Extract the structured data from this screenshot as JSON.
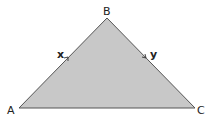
{
  "diagram": {
    "shape": "triangle",
    "fill_color": "#c8c8c8",
    "stroke_color": "#555555",
    "vertices": [
      {
        "label": "A",
        "x": 19,
        "y": 108
      },
      {
        "label": "B",
        "x": 107,
        "y": 18
      },
      {
        "label": "C",
        "x": 195,
        "y": 108
      }
    ],
    "vectors": [
      {
        "label": "x",
        "from": "A",
        "to": "B",
        "direction": "A to B"
      },
      {
        "label": "y",
        "from": "B",
        "to": "C",
        "direction": "B to C"
      }
    ]
  }
}
